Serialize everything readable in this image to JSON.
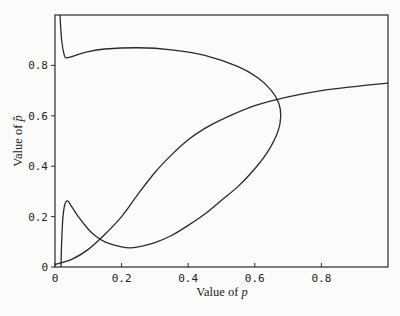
{
  "chart_data": {
    "type": "line",
    "title": "",
    "xlabel": "Value of p",
    "ylabel": "Value of p̂",
    "xlim": [
      0,
      1.0
    ],
    "ylim": [
      0,
      1.0
    ],
    "grid": false,
    "legend": null,
    "x_ticks": [
      {
        "value": 0,
        "label": "0"
      },
      {
        "value": 0.2,
        "label": "0.2"
      },
      {
        "value": 0.4,
        "label": "0.4"
      },
      {
        "value": 0.6,
        "label": "0.6"
      },
      {
        "value": 0.8,
        "label": "0.8"
      }
    ],
    "y_ticks": [
      {
        "value": 0,
        "label": "0"
      },
      {
        "value": 0.2,
        "label": "0.2"
      },
      {
        "value": 0.4,
        "label": "0.4"
      },
      {
        "value": 0.6,
        "label": "0.6"
      },
      {
        "value": 0.8,
        "label": "0.8"
      }
    ],
    "series": [
      {
        "name": "folded-curve",
        "points": [
          [
            0.015,
            1.0
          ],
          [
            0.02,
            0.9
          ],
          [
            0.028,
            0.84
          ],
          [
            0.035,
            0.83
          ],
          [
            0.05,
            0.835
          ],
          [
            0.1,
            0.855
          ],
          [
            0.15,
            0.865
          ],
          [
            0.25,
            0.87
          ],
          [
            0.35,
            0.862
          ],
          [
            0.45,
            0.84
          ],
          [
            0.55,
            0.795
          ],
          [
            0.61,
            0.75
          ],
          [
            0.65,
            0.7
          ],
          [
            0.672,
            0.65
          ],
          [
            0.678,
            0.6
          ],
          [
            0.67,
            0.54
          ],
          [
            0.64,
            0.46
          ],
          [
            0.6,
            0.39
          ],
          [
            0.55,
            0.32
          ],
          [
            0.5,
            0.265
          ],
          [
            0.45,
            0.21
          ],
          [
            0.4,
            0.165
          ],
          [
            0.35,
            0.125
          ],
          [
            0.3,
            0.097
          ],
          [
            0.25,
            0.08
          ],
          [
            0.225,
            0.076
          ],
          [
            0.2,
            0.08
          ],
          [
            0.15,
            0.1
          ],
          [
            0.12,
            0.125
          ],
          [
            0.1,
            0.15
          ],
          [
            0.07,
            0.2
          ],
          [
            0.05,
            0.24
          ],
          [
            0.038,
            0.262
          ],
          [
            0.03,
            0.25
          ],
          [
            0.024,
            0.2
          ],
          [
            0.02,
            0.1
          ],
          [
            0.018,
            0.0
          ]
        ]
      },
      {
        "name": "rising-curve",
        "points": [
          [
            0.0,
            0.01
          ],
          [
            0.05,
            0.03
          ],
          [
            0.1,
            0.07
          ],
          [
            0.15,
            0.13
          ],
          [
            0.2,
            0.2
          ],
          [
            0.25,
            0.29
          ],
          [
            0.3,
            0.375
          ],
          [
            0.35,
            0.445
          ],
          [
            0.4,
            0.505
          ],
          [
            0.45,
            0.55
          ],
          [
            0.5,
            0.585
          ],
          [
            0.6,
            0.64
          ],
          [
            0.7,
            0.675
          ],
          [
            0.8,
            0.7
          ],
          [
            0.9,
            0.716
          ],
          [
            1.0,
            0.73
          ]
        ]
      }
    ]
  },
  "labels": {
    "xlabel_prefix": "Value of ",
    "xlabel_var": "p",
    "ylabel_prefix": "Value of ",
    "ylabel_var": "p̂"
  },
  "style": {
    "line_color": "#2a2a2a",
    "frame_color": "#2a2a2a",
    "background": "#fbfbf9"
  }
}
